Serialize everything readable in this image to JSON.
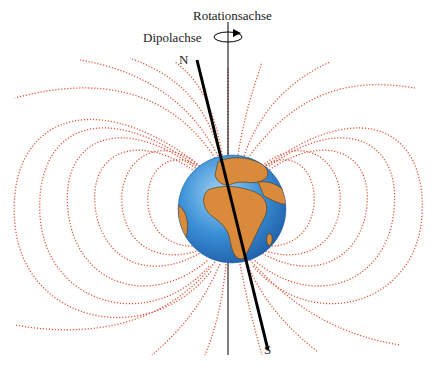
{
  "diagram": {
    "labels": {
      "rotation_axis": "Rotationsachse",
      "dipole_axis": "Dipolachse",
      "north": "N",
      "south": "S"
    },
    "colors": {
      "field_lines": "#e0553a",
      "ocean": "#3a8fd6",
      "land": "#d98a3a",
      "axis": "#000000"
    }
  }
}
